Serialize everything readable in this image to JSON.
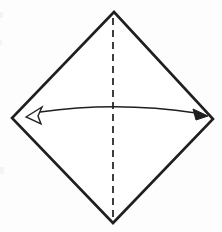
{
  "diagram": {
    "type": "origami-step",
    "colors": {
      "line": "#1f1f1f",
      "background": "#fdfdfd",
      "paper_fill": "#ffffff"
    },
    "paper": {
      "shape": "diamond (square rotated 45 degrees)",
      "vertices": "114,12 213,119 113,223 12,118"
    },
    "fold_line": {
      "style": "dashed",
      "meaning": "valley fold (fold in half vertically)",
      "path": "M 113 18 L 113 218"
    },
    "arrow": {
      "meaning": "fold left corner to right corner and unfold",
      "shaft_path": "M 40 112 Q 118 101 196 113",
      "open_head_points": "26,117 42,107 38,116 41,124",
      "solid_head_points": "208,116 193,109 196,120"
    },
    "smudges": [
      {
        "x": 0,
        "y": 12,
        "w": 3,
        "h": 6
      },
      {
        "x": 0,
        "y": 40,
        "w": 2,
        "h": 5
      },
      {
        "x": 0,
        "y": 167,
        "w": 4,
        "h": 7
      }
    ]
  }
}
